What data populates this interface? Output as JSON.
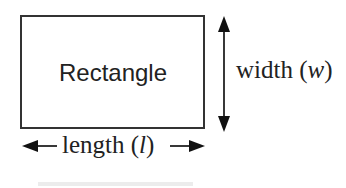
{
  "diagram": {
    "shape_label": "Rectangle",
    "width_label": {
      "text": "width (",
      "var": "w",
      "close": ")"
    },
    "length_label": {
      "text": "length (",
      "var": "l",
      "close": ")"
    },
    "colors": {
      "stroke": "#333333",
      "text": "#222222",
      "background": "#ffffff"
    }
  }
}
